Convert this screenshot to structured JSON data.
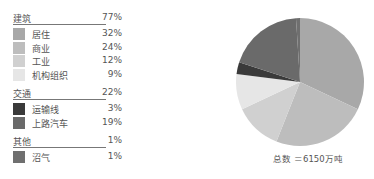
{
  "legend": {
    "groups": [
      {
        "label": "建筑",
        "pct": "77%",
        "items": [
          {
            "label": "居住",
            "pct": "32%",
            "color": "#a8a8a8"
          },
          {
            "label": "商业",
            "pct": "24%",
            "color": "#bdbdbd"
          },
          {
            "label": "工业",
            "pct": "12%",
            "color": "#d0d0d0"
          },
          {
            "label": "机构组织",
            "pct": "9%",
            "color": "#e6e6e6"
          }
        ]
      },
      {
        "label": "交通",
        "pct": "22%",
        "items": [
          {
            "label": "运输线",
            "pct": "3%",
            "color": "#3a3a3a"
          },
          {
            "label": "上路汽车",
            "pct": "19%",
            "color": "#6a6a6a"
          }
        ]
      },
      {
        "label": "其他",
        "pct": "1%",
        "items": [
          {
            "label": "沼气",
            "pct": "1%",
            "color": "#6f6f6f"
          }
        ]
      }
    ]
  },
  "caption": "总数 ＝6150万吨",
  "chart_data": {
    "type": "pie",
    "title": "",
    "total_label": "总数 ＝6150万吨",
    "groups": [
      {
        "name": "建筑",
        "value": 77,
        "children": [
          {
            "name": "居住",
            "value": 32
          },
          {
            "name": "商业",
            "value": 24
          },
          {
            "name": "工业",
            "value": 12
          },
          {
            "name": "机构组织",
            "value": 9
          }
        ]
      },
      {
        "name": "交通",
        "value": 22,
        "children": [
          {
            "name": "运输线",
            "value": 3
          },
          {
            "name": "上路汽车",
            "value": 19
          }
        ]
      },
      {
        "name": "其他",
        "value": 1,
        "children": [
          {
            "name": "沼气",
            "value": 1
          }
        ]
      }
    ],
    "categories": [
      "居住",
      "商业",
      "工业",
      "机构组织",
      "运输线",
      "上路汽车",
      "沼气"
    ],
    "values": [
      32,
      24,
      12,
      9,
      3,
      19,
      1
    ],
    "colors": [
      "#a8a8a8",
      "#bdbdbd",
      "#d0d0d0",
      "#e6e6e6",
      "#3a3a3a",
      "#6a6a6a",
      "#6f6f6f"
    ],
    "unit": "%",
    "legend_position": "left"
  }
}
